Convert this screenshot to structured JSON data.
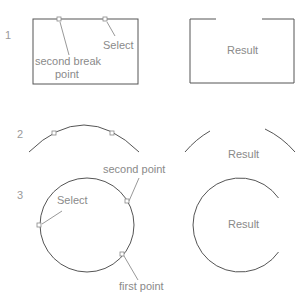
{
  "steps": [
    {
      "number": "1",
      "labels": {
        "select": "Select",
        "break_point_line1": "second break",
        "break_point_line2": "point",
        "result": "Result"
      },
      "shape": "rectangle"
    },
    {
      "number": "2",
      "labels": {
        "result": "Result"
      },
      "shape": "arc"
    },
    {
      "number": "3",
      "labels": {
        "select": "Select",
        "second_point": "second point",
        "first_point": "first point",
        "result": "Result"
      },
      "shape": "circle"
    }
  ],
  "colors": {
    "stroke": "#555555",
    "label": "#8a8a8a",
    "marker": "#888888"
  }
}
